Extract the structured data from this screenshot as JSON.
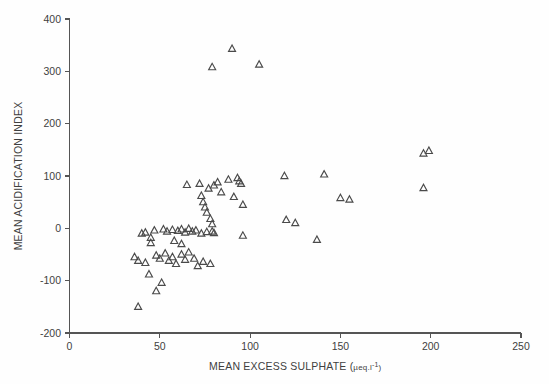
{
  "chart_data": {
    "type": "scatter",
    "title": "",
    "xlabel": "MEAN EXCESS SULPHATE (µeq.l⁻¹)",
    "xlabel_parts": {
      "main": "MEAN EXCESS SULPHATE (",
      "mu": "µeq.l",
      "exponent": "-1",
      "close": ")"
    },
    "ylabel": "MEAN ACIDIFICATION INDEX",
    "xlim": [
      0,
      250
    ],
    "ylim": [
      -200,
      400
    ],
    "xticks": [
      0,
      50,
      100,
      150,
      200,
      250
    ],
    "yticks": [
      -200,
      -100,
      0,
      100,
      200,
      300,
      400
    ],
    "xticklabels": [
      "0",
      "50",
      "100",
      "150",
      "200",
      "250"
    ],
    "yticklabels": [
      "-200",
      "-100",
      "0",
      "100",
      "200",
      "300",
      "400"
    ],
    "grid": false,
    "legend": null,
    "marker": "triangle-up-open",
    "marker_color": "#4a4a4a",
    "marker_size": 7,
    "n_points": 73,
    "points": [
      [
        90,
        343
      ],
      [
        79,
        308
      ],
      [
        105,
        313
      ],
      [
        65,
        83
      ],
      [
        72,
        85
      ],
      [
        77,
        76
      ],
      [
        80,
        82
      ],
      [
        82,
        88
      ],
      [
        84,
        69
      ],
      [
        88,
        93
      ],
      [
        93,
        96
      ],
      [
        94,
        90
      ],
      [
        95,
        85
      ],
      [
        73,
        62
      ],
      [
        74,
        50
      ],
      [
        75,
        40
      ],
      [
        76,
        30
      ],
      [
        78,
        18
      ],
      [
        91,
        60
      ],
      [
        96,
        45
      ],
      [
        79,
        8
      ],
      [
        119,
        100
      ],
      [
        141,
        103
      ],
      [
        196,
        143
      ],
      [
        199,
        148
      ],
      [
        196,
        77
      ],
      [
        150,
        58
      ],
      [
        155,
        55
      ],
      [
        120,
        16
      ],
      [
        125,
        10
      ],
      [
        137,
        -22
      ],
      [
        96,
        -14
      ],
      [
        40,
        -10
      ],
      [
        42,
        -8
      ],
      [
        45,
        -18
      ],
      [
        47,
        -4
      ],
      [
        52,
        -2
      ],
      [
        54,
        -6
      ],
      [
        57,
        -3
      ],
      [
        60,
        -5
      ],
      [
        62,
        -2
      ],
      [
        64,
        -8
      ],
      [
        66,
        -1
      ],
      [
        68,
        -6
      ],
      [
        70,
        -4
      ],
      [
        73,
        -10
      ],
      [
        76,
        -7
      ],
      [
        79,
        -6
      ],
      [
        80,
        -9
      ],
      [
        36,
        -55
      ],
      [
        38,
        -62
      ],
      [
        42,
        -66
      ],
      [
        48,
        -52
      ],
      [
        50,
        -58
      ],
      [
        53,
        -48
      ],
      [
        55,
        -62
      ],
      [
        57,
        -55
      ],
      [
        59,
        -68
      ],
      [
        62,
        -50
      ],
      [
        64,
        -60
      ],
      [
        66,
        -46
      ],
      [
        69,
        -58
      ],
      [
        71,
        -72
      ],
      [
        74,
        -64
      ],
      [
        78,
        -68
      ],
      [
        45,
        -28
      ],
      [
        58,
        -24
      ],
      [
        62,
        -30
      ],
      [
        44,
        -88
      ],
      [
        48,
        -120
      ],
      [
        51,
        -104
      ],
      [
        38,
        -150
      ]
    ]
  }
}
